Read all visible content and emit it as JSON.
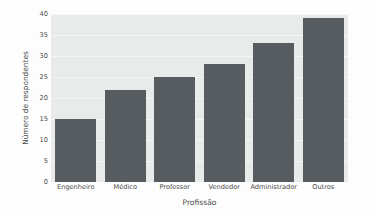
{
  "chart_data": {
    "type": "bar",
    "title": "",
    "subtitle": "",
    "xlabel": "Profissão",
    "ylabel": "Número de respondentes",
    "categories": [
      "Engenheiro",
      "Médico",
      "Professor",
      "Vendedor",
      "Administrador",
      "Outros"
    ],
    "values": [
      15,
      22,
      25,
      28,
      33,
      39
    ],
    "series": [
      {
        "name": "Número de respondentes",
        "values": [
          15,
          22,
          25,
          28,
          33,
          39
        ]
      }
    ],
    "ylim": [
      0,
      40
    ],
    "yticks": [
      0,
      5,
      10,
      15,
      20,
      25,
      30,
      35,
      40
    ],
    "ytick_labels": [
      "0",
      "5",
      "10",
      "15",
      "20",
      "25",
      "30",
      "35",
      "40"
    ],
    "xtick_labels": [
      "Engenheiro",
      "Médico",
      "Professor",
      "Vendedor",
      "Administrador",
      "Outros"
    ],
    "grid": true,
    "grid_axis": "y",
    "legend": false,
    "legend_position": "none",
    "annotations": [],
    "colors": {
      "bar": "#565c5f",
      "plot_background": "#e9eaea",
      "figure_background": "#fdfdfd",
      "gridline": "#f4f5f5",
      "text": "#4a4a4a"
    },
    "bar_width_ratio": 0.82
  }
}
